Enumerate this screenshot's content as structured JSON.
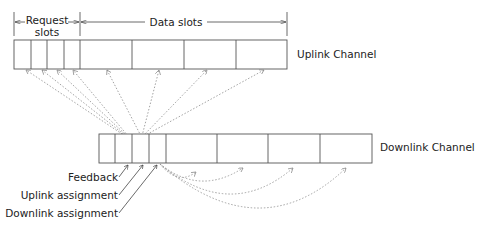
{
  "uplink": {
    "label": "Uplink Channel",
    "request_slots_label_line1": "Request",
    "request_slots_label_line2": "slots",
    "data_slots_label": "Data slots",
    "request_slot_count": 4,
    "data_slot_count": 4
  },
  "downlink": {
    "label": "Downlink Channel",
    "control_slot_count": 4,
    "data_slot_count": 4
  },
  "annotations": {
    "feedback": "Feedback",
    "uplink_assignment": "Uplink assignment",
    "downlink_assignment": "Downlink assignment"
  },
  "colors": {
    "box_stroke": "#555555",
    "arrow_dotted": "#999999",
    "text": "#222222"
  }
}
